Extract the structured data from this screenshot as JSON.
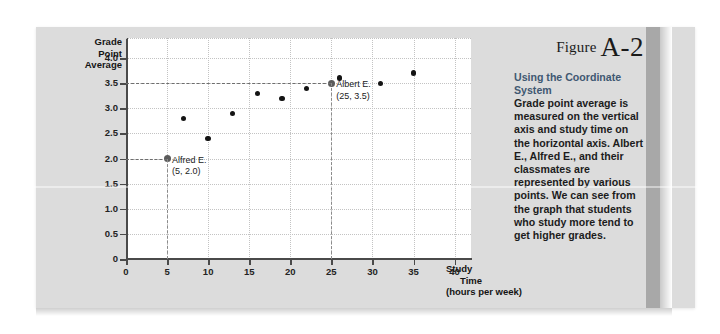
{
  "figure": {
    "label_word": "Figure",
    "label_number": "A-2",
    "title": "Using the Coordinate System",
    "body": "Grade point average is measured on the vertical axis and study time on the horizontal axis. Albert E., Alfred E., and their classmates are represented by various points. We can see from the graph that students who study more tend to get higher grades."
  },
  "chart_data": {
    "type": "scatter",
    "title": "",
    "ylabel": "Grade Point Average",
    "xlabel": "Study Time",
    "xlabel_sub": "(hours per week)",
    "xlabel_lines": [
      "Study",
      "Time",
      "(hours per week)"
    ],
    "ylabel_lines": [
      "Grade",
      "Point",
      "Average"
    ],
    "xlim": [
      0,
      42
    ],
    "ylim": [
      0,
      4.4
    ],
    "xticks": [
      0,
      5,
      10,
      15,
      20,
      25,
      30,
      35,
      40
    ],
    "xtick_labels": [
      "0",
      "5",
      "10",
      "15",
      "20",
      "25",
      "30",
      "35",
      "40"
    ],
    "yticks": [
      0,
      0.5,
      1.0,
      1.5,
      2.0,
      2.5,
      3.0,
      3.5,
      4.0
    ],
    "ytick_labels": [
      "0",
      "0.5",
      "1.0",
      "1.5",
      "2.0",
      "2.5",
      "3.0",
      "3.5",
      "4.0"
    ],
    "grid": true,
    "legend": "none",
    "points": [
      {
        "x": 5,
        "y": 2.0,
        "highlight": true
      },
      {
        "x": 7,
        "y": 2.8,
        "highlight": false
      },
      {
        "x": 10,
        "y": 2.4,
        "highlight": false
      },
      {
        "x": 13,
        "y": 2.9,
        "highlight": false
      },
      {
        "x": 16,
        "y": 3.3,
        "highlight": false
      },
      {
        "x": 19,
        "y": 3.2,
        "highlight": false
      },
      {
        "x": 22,
        "y": 3.4,
        "highlight": false
      },
      {
        "x": 25,
        "y": 3.5,
        "highlight": true
      },
      {
        "x": 26,
        "y": 3.6,
        "highlight": false
      },
      {
        "x": 31,
        "y": 3.5,
        "highlight": false
      },
      {
        "x": 35,
        "y": 3.7,
        "highlight": false
      }
    ],
    "annotations": [
      {
        "name": "Alfred E.",
        "coords": "(5, 2.0)",
        "x": 5,
        "y": 2.0
      },
      {
        "name": "Albert E.",
        "coords": "(25, 3.5)",
        "x": 25,
        "y": 3.5
      }
    ]
  }
}
